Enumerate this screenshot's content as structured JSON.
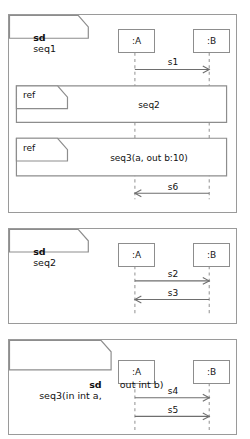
{
  "diagram": {
    "kind": "uml-sequence-diagram-set",
    "keyword": "sd",
    "ref_keyword": "ref",
    "panels": [
      {
        "id": "seq1",
        "frame_keyword": "sd",
        "frame_name": "seq1",
        "frame_name_lines": [
          "seq1"
        ],
        "lifelines": [
          {
            "id": "A",
            "label": ":A"
          },
          {
            "id": "B",
            "label": ":B"
          }
        ],
        "messages": [
          {
            "label": "s1",
            "from": "A",
            "to": "B",
            "direction": "right"
          },
          {
            "label": "s6",
            "from": "B",
            "to": "A",
            "direction": "left"
          }
        ],
        "refs": [
          {
            "keyword": "ref",
            "name": "seq2"
          },
          {
            "keyword": "ref",
            "name": "seq3(a, out b:10)"
          }
        ]
      },
      {
        "id": "seq2",
        "frame_keyword": "sd",
        "frame_name": "seq2",
        "frame_name_lines": [
          "seq2"
        ],
        "lifelines": [
          {
            "id": "A",
            "label": ":A"
          },
          {
            "id": "B",
            "label": ":B"
          }
        ],
        "messages": [
          {
            "label": "s2",
            "from": "A",
            "to": "B",
            "direction": "right"
          },
          {
            "label": "s3",
            "from": "B",
            "to": "A",
            "direction": "left"
          }
        ],
        "refs": []
      },
      {
        "id": "seq3",
        "frame_keyword": "sd",
        "frame_name": "seq3(in int a, out int b)",
        "frame_name_lines": [
          "seq3(in int a,",
          "out int b)"
        ],
        "lifelines": [
          {
            "id": "A",
            "label": ":A"
          },
          {
            "id": "B",
            "label": ":B"
          }
        ],
        "messages": [
          {
            "label": "s4",
            "from": "A",
            "to": "B",
            "direction": "right"
          },
          {
            "label": "s5",
            "from": "A",
            "to": "B",
            "direction": "right"
          }
        ],
        "refs": []
      }
    ]
  },
  "colors": {
    "background": "#ffffff",
    "border": "#9a9a9a",
    "line": "#8d8d8d",
    "arrow": "#6e6e6e",
    "text": "#111111"
  }
}
